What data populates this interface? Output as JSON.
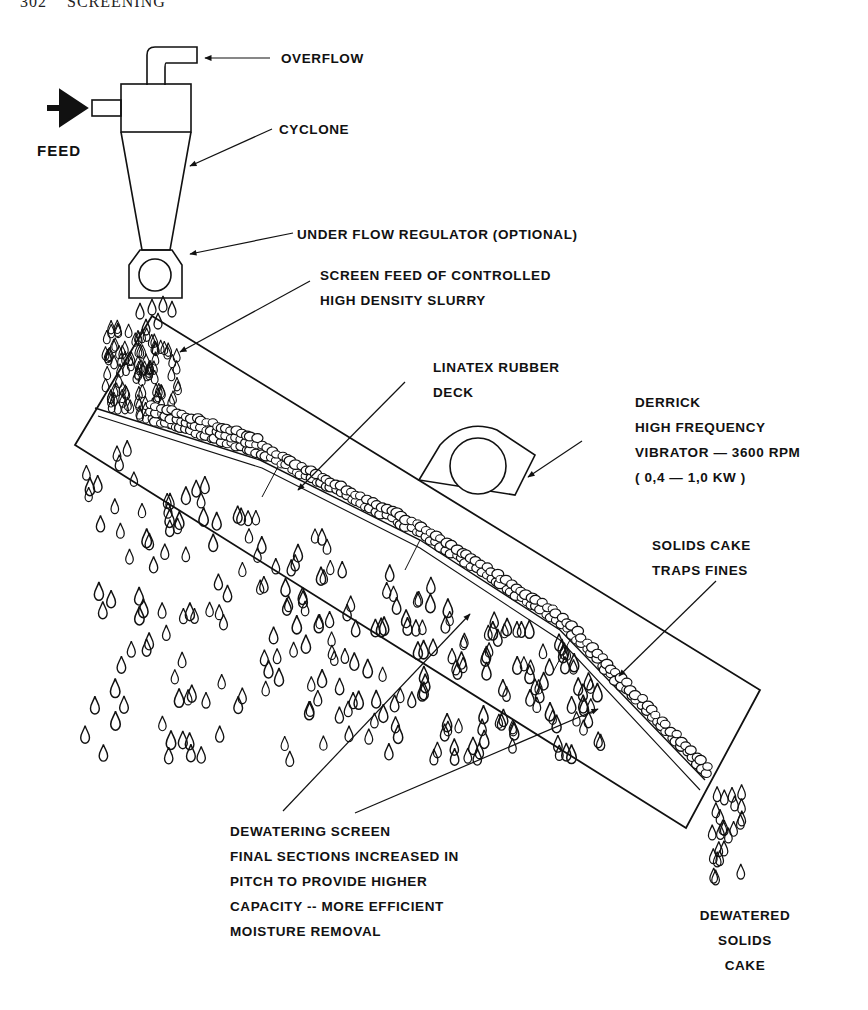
{
  "page_header": {
    "number": "302",
    "title": "SCREENING"
  },
  "labels": {
    "overflow": "OVERFLOW",
    "feed": "FEED",
    "cyclone": "CYCLONE",
    "underflow_regulator": "UNDER FLOW REGULATOR (OPTIONAL)",
    "screen_feed": [
      "SCREEN FEED OF CONTROLLED",
      "HIGH DENSITY SLURRY"
    ],
    "linatex": [
      "LINATEX RUBBER",
      "DECK"
    ],
    "vibrator": [
      "DERRICK",
      "HIGH FREQUENCY",
      "VIBRATOR — 3600 RPM",
      "( 0,4 — 1,0 KW )"
    ],
    "solids_cake": [
      "SOLIDS CAKE",
      "TRAPS FINES"
    ],
    "dewatering_screen": [
      "DEWATERING SCREEN",
      "FINAL SECTIONS INCREASED IN",
      "PITCH TO PROVIDE HIGHER",
      "CAPACITY -- MORE EFFICIENT",
      "MOISTURE REMOVAL"
    ],
    "dewatered_cake": [
      "DEWATERED",
      "SOLIDS",
      "CAKE"
    ]
  },
  "components": {
    "cyclone": "cyclone-icon",
    "feed_arrow": "feed-arrow-icon",
    "underflow_regulator": "regulator-icon",
    "screen_deck": "inclined-screen",
    "vibrator_motor": "vibrator-motor-icon",
    "water_drops": "droplet-icon",
    "solids_particles": "particle-icon"
  },
  "colors": {
    "ink": "#111111",
    "paper": "#ffffff"
  }
}
